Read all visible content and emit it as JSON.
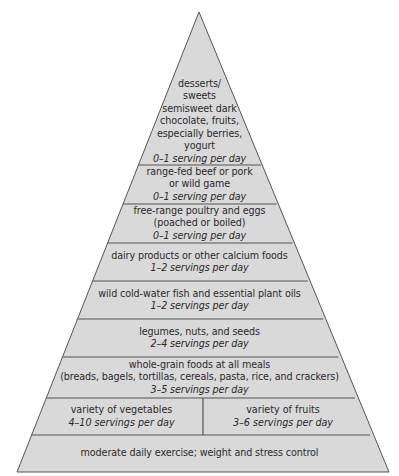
{
  "colors": {
    "fill": "#d9d9d9",
    "line": "#555555",
    "background": "#ffffff",
    "text": "#2a2a2a"
  },
  "pyramid": {
    "layers": [
      {
        "id": "sweets",
        "lines": [
          "desserts/",
          "sweets",
          "semisweet dark",
          "chocolate, fruits,",
          "especially berries,",
          "yogurt"
        ],
        "servings": "0–1 serving per day"
      },
      {
        "id": "meat",
        "lines": [
          "range-fed beef or pork",
          "or wild game"
        ],
        "servings": "0–1 serving per day"
      },
      {
        "id": "poultry",
        "lines": [
          "free-range poultry and eggs",
          "(poached or boiled)"
        ],
        "servings": "0–1 serving per day"
      },
      {
        "id": "dairy",
        "lines": [
          "dairy products or other calcium foods"
        ],
        "servings": "1–2 servings per day"
      },
      {
        "id": "fish",
        "lines": [
          "wild cold-water fish and essential plant oils"
        ],
        "servings": "1–2 servings per day"
      },
      {
        "id": "legumes",
        "lines": [
          "legumes, nuts, and seeds"
        ],
        "servings": "2–4 servings per day"
      },
      {
        "id": "grains",
        "lines": [
          "whole-grain foods at all meals",
          "(breads, bagels, tortillas, cereals, pasta, rice, and crackers)"
        ],
        "servings": "3–5 servings per day"
      },
      {
        "id": "produce",
        "left": {
          "label": "variety of vegetables",
          "servings": "4–10 servings per day"
        },
        "right": {
          "label": "variety of fruits",
          "servings": "3–6 servings per day"
        }
      },
      {
        "id": "base",
        "lines": [
          "moderate daily exercise; weight and stress control"
        ]
      }
    ]
  }
}
